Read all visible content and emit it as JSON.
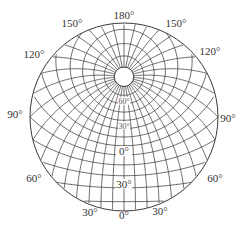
{
  "diagram": {
    "type": "oblique stereographic graticule",
    "center_latitude_deg": 44,
    "meridian_step_deg": 10,
    "parallel_step_deg": 10,
    "polar_cap_latitude_deg": 80,
    "colors": {
      "line": "#3a3a3a",
      "text": "#333333",
      "background": "#ffffff"
    },
    "edge_labels": [
      {
        "id": "lon-180",
        "text": "180°",
        "longitude": 180
      },
      {
        "id": "lon-150-left",
        "text": "150°",
        "longitude": -150
      },
      {
        "id": "lon-150-right",
        "text": "150°",
        "longitude": 150
      },
      {
        "id": "lon-120-left",
        "text": "120°",
        "longitude": -120
      },
      {
        "id": "lon-120-right",
        "text": "120°",
        "longitude": 120
      },
      {
        "id": "lon-90-left",
        "text": "90°",
        "longitude": -90
      },
      {
        "id": "lon-90-right",
        "text": "90°",
        "longitude": 90
      },
      {
        "id": "lon-60-left",
        "text": "60°",
        "longitude": -60
      },
      {
        "id": "lon-60-right",
        "text": "60°",
        "longitude": 60
      },
      {
        "id": "lon-30-left",
        "text": "30°",
        "longitude": -30
      },
      {
        "id": "lon-30-right",
        "text": "30°",
        "longitude": 30
      },
      {
        "id": "lon-0",
        "text": "0°",
        "longitude": 0
      }
    ],
    "latitude_labels": [
      {
        "id": "lat-60n",
        "text": "60°",
        "latitude": 60
      },
      {
        "id": "lat-30n",
        "text": "30°",
        "latitude": 30
      },
      {
        "id": "lat-0",
        "text": "0°",
        "latitude": 0
      },
      {
        "id": "lat-30s",
        "text": "30°",
        "latitude": -30
      }
    ]
  }
}
